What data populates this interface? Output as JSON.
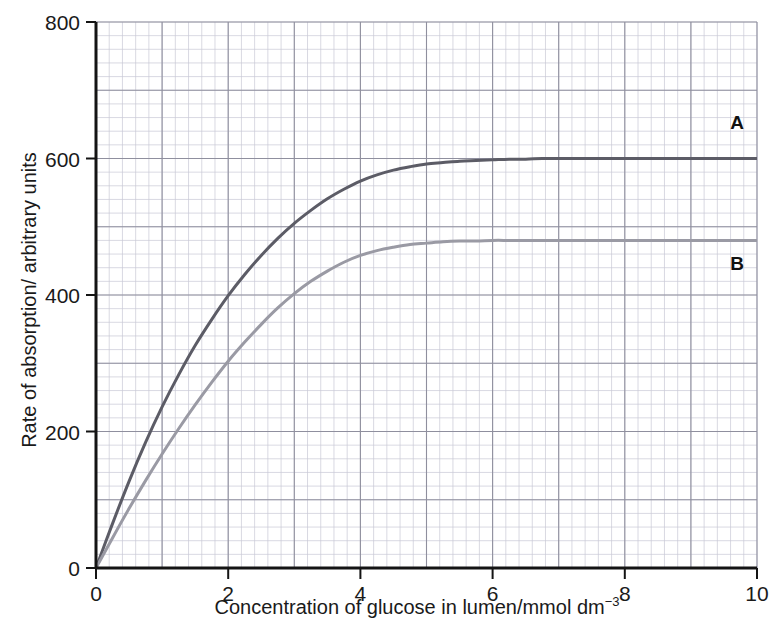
{
  "chart_data": {
    "type": "line",
    "title": "",
    "subtitle": "",
    "xlabel": "Concentration of glucose in lumen/mmol dm",
    "xlabel_superscript": "−3",
    "ylabel": "Rate of  absorption/ arbitrary units",
    "xlim": [
      0,
      10
    ],
    "ylim": [
      0,
      800
    ],
    "xticks": [
      0,
      2,
      4,
      6,
      8,
      10
    ],
    "xtick_labels": [
      "0",
      "2",
      "4",
      "6",
      "8",
      "10"
    ],
    "yticks": [
      0,
      200,
      400,
      600,
      800
    ],
    "ytick_labels": [
      "0",
      "200",
      "400",
      "600",
      "800"
    ],
    "grid": true,
    "grid_minor_step_x": 0.2,
    "grid_minor_step_y": 20,
    "grid_major_step_x": 1,
    "grid_major_step_y": 100,
    "grid_minor_color": "#c9c9d6",
    "grid_major_color": "#8f8f9e",
    "legend_position": "inline-right-of-curves",
    "axis_color": "#141414",
    "background": "#ffffff",
    "x": [
      0,
      0.25,
      0.5,
      0.75,
      1,
      1.25,
      1.5,
      1.75,
      2,
      2.25,
      2.5,
      2.75,
      3,
      3.25,
      3.5,
      3.75,
      4,
      4.25,
      4.5,
      4.75,
      5,
      5.25,
      5.5,
      5.75,
      6,
      6.25,
      6.5,
      6.75,
      7,
      7.25,
      7.5,
      7.75,
      8,
      8.5,
      9,
      9.5,
      10
    ],
    "series": [
      {
        "name": "A",
        "label": "A",
        "color": "#5c5c66",
        "width": 3.0,
        "plateau": 600,
        "half_saturation": 1.7,
        "values": [
          0,
          65,
          127,
          184,
          236,
          283,
          326,
          364,
          399,
          430,
          458,
          483,
          505,
          524,
          541,
          555,
          567,
          576,
          583,
          588,
          592,
          594,
          596,
          597,
          598,
          599,
          599,
          600,
          600,
          600,
          600,
          600,
          600,
          600,
          600,
          600,
          600
        ]
      },
      {
        "name": "B",
        "label": "B",
        "color": "#9a9aa4",
        "width": 3.0,
        "plateau": 480,
        "half_saturation": 2.6,
        "values": [
          0,
          44,
          87,
          128,
          167,
          204,
          239,
          272,
          303,
          331,
          357,
          381,
          402,
          420,
          435,
          448,
          458,
          465,
          470,
          474,
          476,
          478,
          479,
          479,
          480,
          480,
          480,
          480,
          480,
          480,
          480,
          480,
          480,
          480,
          480,
          480,
          480
        ]
      }
    ],
    "annotations": [
      {
        "text": "A",
        "x": 9.7,
        "y": 643,
        "series": "A"
      },
      {
        "text": "B",
        "x": 9.7,
        "y": 437,
        "series": "B"
      }
    ]
  }
}
